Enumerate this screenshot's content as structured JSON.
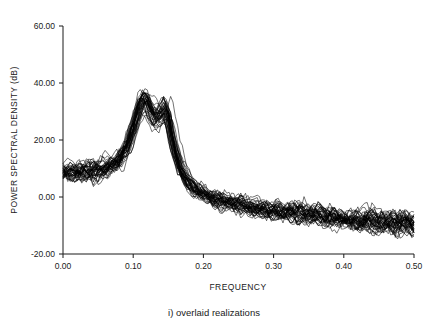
{
  "figure": {
    "caption": "i) overlaid realizations",
    "background_color": "#ffffff",
    "ink_color": "#000000"
  },
  "chart_data": {
    "type": "line",
    "title": "",
    "subtitle": "",
    "xlabel": "FREQUENCY",
    "ylabel": "POWER SPECTRAL DENSITY (dB)",
    "xlim": [
      0.0,
      0.5
    ],
    "ylim": [
      -20.0,
      60.0
    ],
    "xticks": [
      0.0,
      0.1,
      0.2,
      0.3,
      0.4,
      0.5
    ],
    "xtick_labels": [
      "0.00",
      "0.10",
      "0.20",
      "0.30",
      "0.40",
      "0.50"
    ],
    "yticks": [
      -20.0,
      0.0,
      20.0,
      40.0,
      60.0
    ],
    "ytick_labels": [
      "-20.00",
      "0.00",
      "20.00",
      "40.00",
      "60.00"
    ],
    "grid": false,
    "legend": null,
    "legend_position": "none",
    "n_realizations": 40,
    "series_description": "Overlaid power spectral density estimates of an AR process with two closely spaced spectral peaks; each trace is one noisy realization.",
    "mean_spectrum": {
      "x": [
        0.0,
        0.01,
        0.02,
        0.03,
        0.04,
        0.05,
        0.06,
        0.07,
        0.08,
        0.09,
        0.1,
        0.105,
        0.11,
        0.115,
        0.12,
        0.125,
        0.13,
        0.135,
        0.14,
        0.145,
        0.15,
        0.155,
        0.16,
        0.17,
        0.18,
        0.19,
        0.2,
        0.22,
        0.24,
        0.26,
        0.28,
        0.3,
        0.32,
        0.34,
        0.36,
        0.38,
        0.4,
        0.42,
        0.44,
        0.46,
        0.48,
        0.5
      ],
      "y": [
        8.5,
        8.6,
        8.8,
        9.0,
        9.2,
        9.6,
        10.2,
        11.2,
        13.0,
        16.5,
        23.5,
        28.0,
        32.0,
        34.0,
        33.2,
        30.5,
        28.0,
        27.5,
        29.0,
        31.0,
        28.5,
        22.0,
        16.0,
        9.0,
        5.0,
        2.5,
        1.0,
        -1.0,
        -2.2,
        -3.2,
        -4.0,
        -4.6,
        -5.2,
        -5.8,
        -6.4,
        -7.0,
        -7.6,
        -8.1,
        -8.5,
        -8.8,
        -9.0,
        -9.2
      ]
    },
    "scatter_band_db": {
      "low_frequency": 4.0,
      "peak_region": 3.0,
      "high_frequency": 5.0
    },
    "notes": [
      "First (dominant) peak near f = 0.115 reaching about 34 dB",
      "Second peak near f = 0.145 reaching about 31 dB",
      "Spectral floor at f = 0 about 8.5 dB",
      "Tail falls to roughly -9 dB at f = 0.50 with about +/-5 dB realization scatter"
    ]
  },
  "axes": {
    "x_axis_name": "frequency-axis",
    "y_axis_name": "power-spectral-density-axis"
  }
}
